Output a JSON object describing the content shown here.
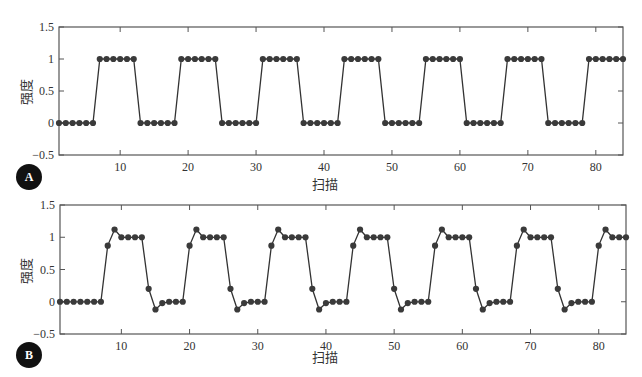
{
  "figure": {
    "panel_a": {
      "badge": "A",
      "ylabel": "强度",
      "xlabel": "扫描"
    },
    "panel_b": {
      "badge": "B",
      "ylabel": "强度",
      "xlabel": "扫描"
    }
  },
  "style": {
    "line_color": "#333333",
    "marker_color": "#3a3a3a",
    "axis_color": "#555555",
    "badge_color": "#111111"
  },
  "chart_data": [
    {
      "type": "line",
      "panel": "A",
      "title": "",
      "xlabel": "扫描",
      "ylabel": "强度",
      "xlim": [
        1,
        84
      ],
      "ylim": [
        -0.5,
        1.5
      ],
      "xticks": [
        10,
        20,
        30,
        40,
        50,
        60,
        70,
        80
      ],
      "yticks": [
        -0.5,
        0,
        0.5,
        1,
        1.5
      ],
      "ytick_labels": [
        "−0.5",
        "0",
        "0.5",
        "1",
        "1.5"
      ],
      "grid": false,
      "markers": true,
      "x": [
        1,
        2,
        3,
        4,
        5,
        6,
        7,
        8,
        9,
        10,
        11,
        12,
        13,
        14,
        15,
        16,
        17,
        18,
        19,
        20,
        21,
        22,
        23,
        24,
        25,
        26,
        27,
        28,
        29,
        30,
        31,
        32,
        33,
        34,
        35,
        36,
        37,
        38,
        39,
        40,
        41,
        42,
        43,
        44,
        45,
        46,
        47,
        48,
        49,
        50,
        51,
        52,
        53,
        54,
        55,
        56,
        57,
        58,
        59,
        60,
        61,
        62,
        63,
        64,
        65,
        66,
        67,
        68,
        69,
        70,
        71,
        72,
        73,
        74,
        75,
        76,
        77,
        78,
        79,
        80,
        81,
        82,
        83,
        84
      ],
      "values": [
        0,
        0,
        0,
        0,
        0,
        0,
        1,
        1,
        1,
        1,
        1,
        1,
        0,
        0,
        0,
        0,
        0,
        0,
        1,
        1,
        1,
        1,
        1,
        1,
        0,
        0,
        0,
        0,
        0,
        0,
        1,
        1,
        1,
        1,
        1,
        1,
        0,
        0,
        0,
        0,
        0,
        0,
        1,
        1,
        1,
        1,
        1,
        1,
        0,
        0,
        0,
        0,
        0,
        0,
        1,
        1,
        1,
        1,
        1,
        1,
        0,
        0,
        0,
        0,
        0,
        0,
        1,
        1,
        1,
        1,
        1,
        1,
        0,
        0,
        0,
        0,
        0,
        0,
        1,
        1,
        1,
        1,
        1,
        1
      ]
    },
    {
      "type": "line",
      "panel": "B",
      "title": "",
      "xlabel": "扫描",
      "ylabel": "强度",
      "xlim": [
        1,
        84
      ],
      "ylim": [
        -0.5,
        1.5
      ],
      "xticks": [
        10,
        20,
        30,
        40,
        50,
        60,
        70,
        80
      ],
      "yticks": [
        -0.5,
        0,
        0.5,
        1,
        1.5
      ],
      "ytick_labels": [
        "−0.5",
        "0",
        "0.5",
        "1",
        "1.5"
      ],
      "grid": false,
      "markers": true,
      "x": [
        1,
        2,
        3,
        4,
        5,
        6,
        7,
        8,
        9,
        10,
        11,
        12,
        13,
        14,
        15,
        16,
        17,
        18,
        19,
        20,
        21,
        22,
        23,
        24,
        25,
        26,
        27,
        28,
        29,
        30,
        31,
        32,
        33,
        34,
        35,
        36,
        37,
        38,
        39,
        40,
        41,
        42,
        43,
        44,
        45,
        46,
        47,
        48,
        49,
        50,
        51,
        52,
        53,
        54,
        55,
        56,
        57,
        58,
        59,
        60,
        61,
        62,
        63,
        64,
        65,
        66,
        67,
        68,
        69,
        70,
        71,
        72,
        73,
        74,
        75,
        76,
        77,
        78,
        79,
        80,
        81,
        82,
        83,
        84
      ],
      "values": [
        0,
        0,
        0,
        0,
        0,
        0,
        0,
        0.87,
        1.12,
        1,
        1,
        1,
        1,
        0.2,
        -0.12,
        -0.02,
        0,
        0,
        0,
        0.87,
        1.12,
        1,
        1,
        1,
        1,
        0.2,
        -0.12,
        -0.02,
        0,
        0,
        0,
        0.87,
        1.12,
        1,
        1,
        1,
        1,
        0.2,
        -0.12,
        -0.02,
        0,
        0,
        0,
        0.87,
        1.12,
        1,
        1,
        1,
        1,
        0.2,
        -0.12,
        -0.02,
        0,
        0,
        0,
        0.87,
        1.12,
        1,
        1,
        1,
        1,
        0.2,
        -0.12,
        -0.02,
        0,
        0,
        0,
        0.87,
        1.12,
        1,
        1,
        1,
        1,
        0.2,
        -0.12,
        -0.02,
        0,
        0,
        0,
        0.87,
        1.12,
        1,
        1,
        1
      ]
    }
  ]
}
